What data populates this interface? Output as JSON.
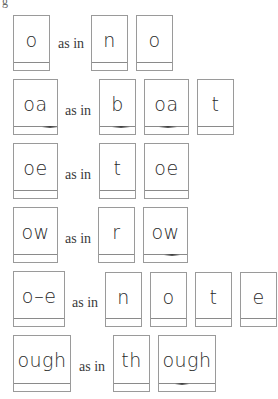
{
  "top_fragment": "g",
  "connector": "as in",
  "rows": [
    {
      "phonogram": "o",
      "example": [
        "n",
        "o"
      ]
    },
    {
      "phonogram": "oa",
      "example": [
        "b",
        "oa",
        "t"
      ]
    },
    {
      "phonogram": "oe",
      "example": [
        "t",
        "oe"
      ]
    },
    {
      "phonogram": "ow",
      "example": [
        "r",
        "ow"
      ]
    },
    {
      "phonogram": "o–e",
      "example": [
        "n",
        "o",
        "t",
        "e"
      ]
    },
    {
      "phonogram": "ough",
      "example": [
        "th",
        "ough"
      ]
    }
  ]
}
